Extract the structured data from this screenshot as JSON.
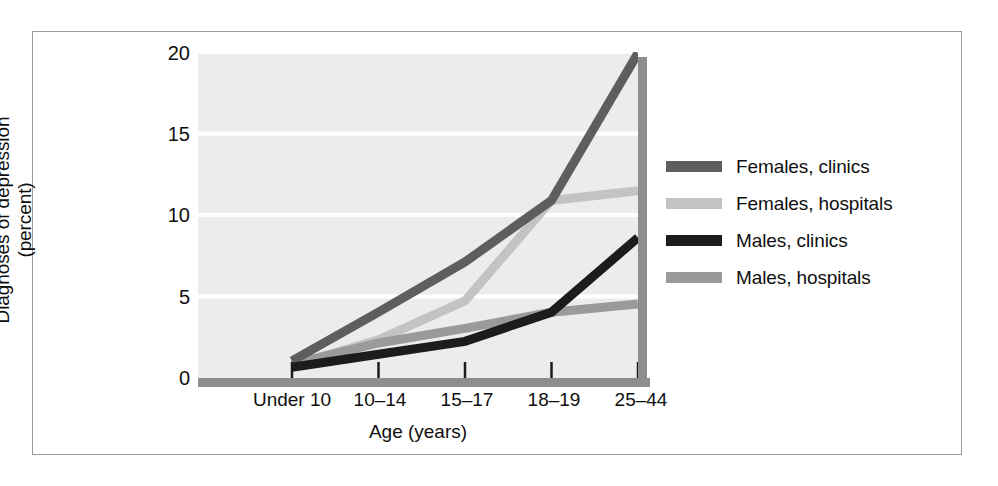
{
  "chart_data": {
    "type": "line",
    "title": "",
    "xlabel": "Age (years)",
    "ylabel": "Diagnoses of depression (percent)",
    "ylabel_line1": "Diagnoses of depression",
    "ylabel_line2": "(percent)",
    "categories": [
      "Under 10",
      "10–14",
      "15–17",
      "18–19",
      "25–44"
    ],
    "yticks": [
      0,
      5,
      10,
      15,
      20
    ],
    "ylim": [
      0,
      20
    ],
    "grid": true,
    "grid_color": "#ffffff",
    "plot_background": "#ececec",
    "legend_position": "right",
    "series": [
      {
        "name": "Females, clinics",
        "color": "#5e5e5e",
        "values": [
          1.0,
          4.0,
          7.1,
          10.9,
          20.0
        ]
      },
      {
        "name": "Females, hospitals",
        "color": "#c3c3c3",
        "values": [
          0.7,
          2.3,
          4.7,
          10.9,
          11.5
        ]
      },
      {
        "name": "Males, clinics",
        "color": "#1c1c1c",
        "values": [
          0.6,
          1.4,
          2.2,
          4.0,
          8.6
        ]
      },
      {
        "name": "Males, hospitals",
        "color": "#9a9a9a",
        "values": [
          0.8,
          2.1,
          3.0,
          4.0,
          4.5
        ]
      }
    ]
  },
  "axis": {
    "spine_color": "#8e8e8e",
    "tick_color": "#1c1c1c"
  },
  "frame": {
    "border_color": "#9a9a9a"
  }
}
